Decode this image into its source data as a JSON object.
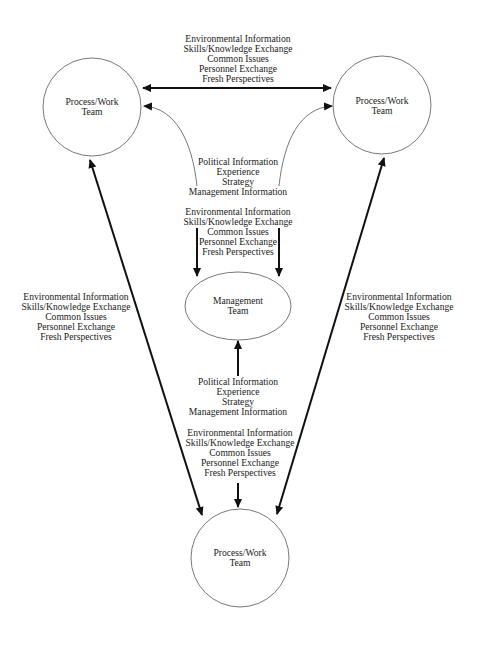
{
  "diagram": {
    "nodes": {
      "top_left": {
        "line1": "Process/Work",
        "line2": "Team"
      },
      "top_right": {
        "line1": "Process/Work",
        "line2": "Team"
      },
      "management": {
        "line1": "Management",
        "line2": "Team"
      },
      "bottom": {
        "line1": "Process/Work",
        "line2": "Team"
      }
    },
    "labels": {
      "top_peer": [
        "Environmental Information",
        "Skills/Knowledge Exchange",
        "Common Issues",
        "Personnel  Exchange",
        "Fresh Perspectives"
      ],
      "mgmt_to_top": [
        "Political Information",
        "Experience",
        "Strategy",
        "Management Information"
      ],
      "top_to_mgmt": [
        "Environmental Information",
        "Skills/Knowledge Exchange",
        "Common Issues",
        "Personnel  Exchange",
        "Fresh Perspectives"
      ],
      "left_peer": [
        "Environmental Information",
        "Skills/Knowledge Exchange",
        "Common Issues",
        "Personnel  Exchange",
        "Fresh Perspectives"
      ],
      "right_peer": [
        "Environmental Information",
        "Skills/Knowledge Exchange",
        "Common Issues",
        "Personnel  Exchange",
        "Fresh Perspectives"
      ],
      "mgmt_to_bottom": [
        "Political Information",
        "Experience",
        "Strategy",
        "Management Information"
      ],
      "bottom_to_mgmt": [
        "Environmental Information",
        "Skills/Knowledge Exchange",
        "Common Issues",
        "Personnel  Exchange",
        "Fresh Perspectives"
      ]
    },
    "colors": {
      "stroke": "#111111",
      "thin_stroke": "#555555",
      "text": "#1a1a1a"
    }
  }
}
